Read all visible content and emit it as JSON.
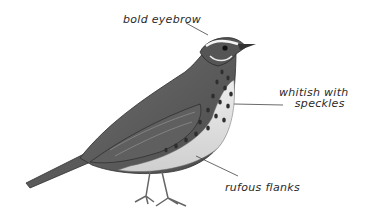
{
  "figure": {
    "annotations": [
      {
        "id": "eyebrow",
        "text": "bold eyebrow"
      },
      {
        "id": "breast",
        "line1": "whitish with",
        "line2": "speckles"
      },
      {
        "id": "flanks",
        "text": "rufous flanks"
      }
    ]
  },
  "colors": {
    "background": "#ffffff",
    "ink": "#2a2a2a",
    "bird_dark": "#3c3c3c",
    "bird_mid": "#7a7a7a",
    "bird_light": "#d8d8d8"
  }
}
